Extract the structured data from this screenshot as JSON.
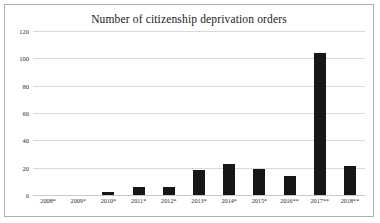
{
  "chart_data": {
    "type": "bar",
    "title": "Number of citizenship deprivation orders",
    "xlabel": "",
    "ylabel": "",
    "categories": [
      "2008*",
      "2009*",
      "2010*",
      "2011*",
      "2012*",
      "2013*",
      "2014*",
      "2015*",
      "2016**",
      "2017**",
      "2018**"
    ],
    "values": [
      0,
      0,
      2,
      6,
      6,
      18,
      23,
      19,
      14,
      104,
      21
    ],
    "ylim": [
      0,
      120
    ],
    "yticks": [
      "0",
      "20",
      "40",
      "60",
      "80",
      "100",
      "120"
    ],
    "ytick_values": [
      0,
      20,
      40,
      60,
      80,
      100,
      120
    ],
    "grid": true,
    "legend": "none",
    "bar_color": "#161616",
    "grid_color": "#d9d9d9",
    "background": "#ffffff",
    "border_color": "#b0b0b0"
  }
}
